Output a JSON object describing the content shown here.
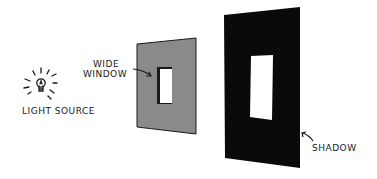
{
  "diagram": {
    "labels": {
      "light_source": "LIGHT SOURCE",
      "wide_window_line1": "WIDE",
      "wide_window_line2": "WINDOW",
      "shadow": "SHADOW"
    },
    "colors": {
      "background": "#ffffff",
      "panel": "#8a8a8a",
      "shadow": "#0a0a0a",
      "ink": "#1a1a1a",
      "window": "#ffffff"
    },
    "elements": [
      "light-bulb",
      "wall-panel-with-window",
      "shadow-on-wall"
    ]
  }
}
